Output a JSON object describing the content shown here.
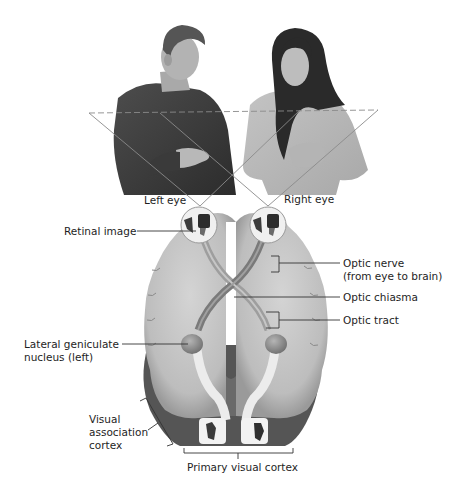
{
  "diagram": {
    "people": {
      "left": "man-in-dark-sweater",
      "right": "woman-with-long-hair"
    },
    "labels": {
      "left_eye": "Left eye",
      "right_eye": "Right eye",
      "retinal_image": "Retinal image",
      "optic_nerve_line1": "Optic nerve",
      "optic_nerve_line2": "(from eye to brain)",
      "optic_chiasma": "Optic chiasma",
      "optic_tract": "Optic tract",
      "lgn_line1": "Lateral geniculate",
      "lgn_line2": "nucleus (left)",
      "vac_line1": "Visual",
      "vac_line2": "association",
      "vac_line3": "cortex",
      "primary_visual_cortex": "Primary visual cortex"
    },
    "colors": {
      "background": "#ffffff",
      "brain": "#c9c9c9",
      "brain_dark": "#5a5a5a",
      "nerve": "#8f8f8f",
      "text": "#1e1e1e",
      "leader": "#333333"
    }
  }
}
